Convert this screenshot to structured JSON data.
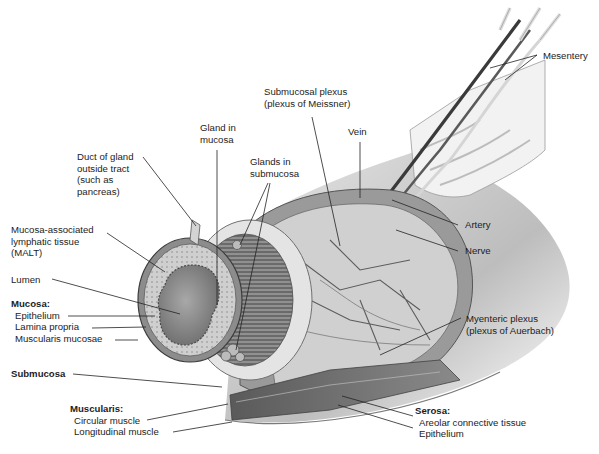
{
  "diagram": {
    "labels": {
      "mesentery": "Mesentery",
      "submucosal_plexus": [
        "Submucosal plexus",
        "(plexus of Meissner)"
      ],
      "vein": "Vein",
      "gland_in_mucosa": [
        "Gland in",
        "mucosa"
      ],
      "glands_in_submucosa": [
        "Glands in",
        "submucosa"
      ],
      "duct_of_gland": [
        "Duct of gland",
        "outside tract",
        "(such as",
        "pancreas)"
      ],
      "malt": [
        "Mucosa-associated",
        "lymphatic tissue",
        "(MALT)"
      ],
      "lumen": "Lumen",
      "artery": "Artery",
      "nerve": "Nerve",
      "myenteric_plexus": [
        "Myenteric plexus",
        "(plexus of Auerbach)"
      ],
      "mucosa": {
        "header": "Mucosa:",
        "items": [
          "Epithelium",
          "Lamina propria",
          "Muscularis mucosae"
        ]
      },
      "submucosa": "Submucosa",
      "muscularis": {
        "header": "Muscularis:",
        "items": [
          "Circular muscle",
          "Longitudinal muscle"
        ]
      },
      "serosa": {
        "header": "Serosa:",
        "items": [
          "Areolar connective tissue",
          "Epithelium"
        ]
      }
    }
  }
}
